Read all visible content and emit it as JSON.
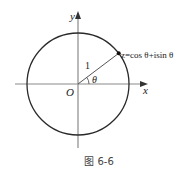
{
  "figure": {
    "caption": "图 6-6",
    "axes": {
      "x_label": "x",
      "y_label": "y",
      "origin_label": "O"
    },
    "circle": {
      "kind": "unit-circle",
      "radius_label": "1"
    },
    "angle_label": "θ",
    "point_label": "z=cos θ+isin θ",
    "point_angle_degrees": 37,
    "colors": {
      "curve": "#2a2a2a",
      "axis": "#8a8a8a",
      "point": "#111111"
    }
  }
}
